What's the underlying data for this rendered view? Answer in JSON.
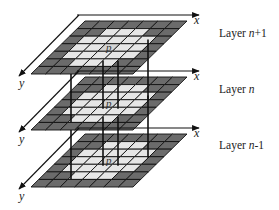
{
  "diagram": {
    "type": "stacked-grid-layers",
    "grid": {
      "columns": 7,
      "rows": 7
    },
    "colors": {
      "dark_cell": "#6b6b6b",
      "light_cell": "#e6e6e6",
      "center_cell": "#d4d4d4",
      "line": "#111111"
    },
    "axis_labels": {
      "x": "x",
      "y": "y"
    },
    "center_label": "p",
    "layers": [
      {
        "name_prefix": "Layer ",
        "name_var": "n",
        "name_suffix": "+1"
      },
      {
        "name_prefix": "Layer ",
        "name_var": "n",
        "name_suffix": ""
      },
      {
        "name_prefix": "Layer ",
        "name_var": "n",
        "name_suffix": "-1"
      }
    ]
  }
}
